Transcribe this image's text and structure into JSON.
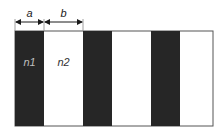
{
  "dimensions": {
    "a_label": "a",
    "b_label": "b"
  },
  "regions": {
    "n1_label": "n1",
    "n2_label": "n2"
  },
  "colors": {
    "dark_stripe": "#262626",
    "light_stripe": "#ffffff",
    "border": "#555555",
    "n1_text": "#bfbfbf",
    "n2_text": "#333333",
    "arrow": "#1a1a1a"
  },
  "stripes": [
    {
      "x": 15,
      "width": 29,
      "type": "dark"
    },
    {
      "x": 44,
      "width": 39,
      "type": "light"
    },
    {
      "x": 83,
      "width": 29,
      "type": "dark"
    },
    {
      "x": 112,
      "width": 39,
      "type": "light"
    },
    {
      "x": 151,
      "width": 29,
      "type": "dark"
    },
    {
      "x": 180,
      "width": 33,
      "type": "light"
    }
  ]
}
